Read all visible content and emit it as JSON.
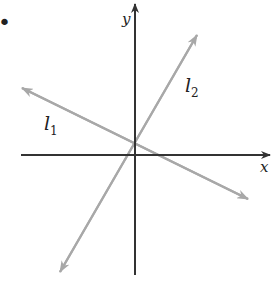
{
  "figure": {
    "bullet": "•",
    "axes": {
      "x_label": "x",
      "y_label": "y",
      "color": "#333333"
    },
    "lines": [
      {
        "name": "l",
        "subscript": "1",
        "color": "#a8a8a8",
        "description": "negative slope line"
      },
      {
        "name": "l",
        "subscript": "2",
        "color": "#a8a8a8",
        "description": "positive slope line"
      }
    ]
  }
}
